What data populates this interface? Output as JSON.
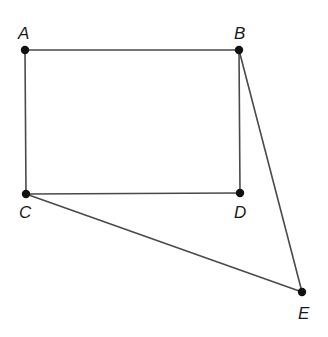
{
  "diagram": {
    "type": "geometry",
    "points": [
      {
        "id": "A",
        "label": "A",
        "x": 25,
        "y": 50,
        "lx": 18,
        "ly": 39
      },
      {
        "id": "B",
        "label": "B",
        "x": 239,
        "y": 50,
        "lx": 234,
        "ly": 39
      },
      {
        "id": "C",
        "label": "C",
        "x": 26,
        "y": 194,
        "lx": 19,
        "ly": 218
      },
      {
        "id": "D",
        "label": "D",
        "x": 240,
        "y": 193,
        "lx": 234,
        "ly": 218
      },
      {
        "id": "E",
        "label": "E",
        "x": 302,
        "y": 292,
        "lx": 298,
        "ly": 319
      }
    ],
    "segments": [
      {
        "from": "A",
        "to": "B"
      },
      {
        "from": "A",
        "to": "C"
      },
      {
        "from": "B",
        "to": "D"
      },
      {
        "from": "C",
        "to": "D"
      },
      {
        "from": "B",
        "to": "E"
      },
      {
        "from": "C",
        "to": "E"
      }
    ],
    "colors": {
      "line": "#4a4a4a",
      "point": "#111111",
      "label": "#1a1a1a"
    }
  }
}
